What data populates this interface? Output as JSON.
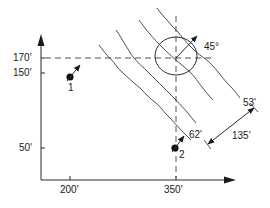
{
  "diagram": {
    "type": "well-location plan with strata contours",
    "axes": {
      "y_ticks": [
        {
          "label": "170'",
          "y": 58
        },
        {
          "label": "150'",
          "y": 73
        },
        {
          "label": "50'",
          "y": 148
        }
      ],
      "x_ticks": [
        {
          "label": "200'",
          "x": 70
        },
        {
          "label": "350'",
          "x": 176
        }
      ]
    },
    "points": [
      {
        "id": "1",
        "label": "1"
      },
      {
        "id": "2",
        "label": "2",
        "distance_label": "62'"
      }
    ],
    "ellipse": {
      "angle_label": "45°"
    },
    "dimensions": {
      "width_label": "135'",
      "offset_label": "53'"
    },
    "colors": {
      "line": "#2a2a2a",
      "background": "#ffffff"
    }
  }
}
